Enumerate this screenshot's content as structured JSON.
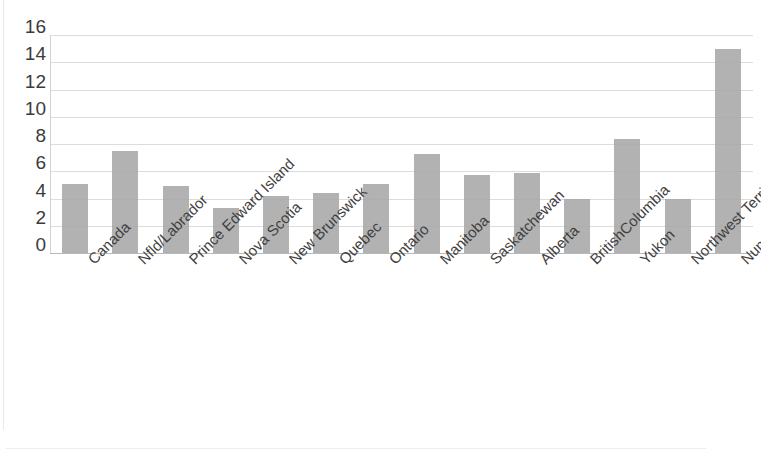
{
  "chart_data": {
    "type": "bar",
    "title": "",
    "subtitle": "",
    "xlabel": "",
    "ylabel": "",
    "categories": [
      "Canada",
      "Nfld/Labrador",
      "Prince Edward Island",
      "Nova Scotia",
      "New Brunswick",
      "Quebec",
      "Ontario",
      "Manitoba",
      "Saskatchewan",
      "Alberta",
      "BritishColumbia",
      "Yukon",
      "Northwest Territories",
      "Nunavut"
    ],
    "values": [
      5.1,
      7.5,
      4.9,
      3.3,
      4.2,
      4.4,
      5.1,
      7.3,
      5.7,
      5.9,
      4.0,
      8.4,
      4.0,
      15.0
    ],
    "ylim": [
      0,
      16
    ],
    "ytick_labels": [
      "0",
      "2",
      "4",
      "6",
      "8",
      "10",
      "12",
      "14",
      "16"
    ],
    "ytick_values": [
      0,
      2,
      4,
      6,
      8,
      10,
      12,
      14,
      16
    ],
    "grid": true,
    "legend": false,
    "legend_position": "none",
    "bar_color": "#a7a7a7",
    "gridline_color": "#dcdcdc",
    "axis_color": "#b9b9b9",
    "label_color": "#3f3f3f",
    "background_color": "#ffffff",
    "x_label_rotation": -45
  }
}
